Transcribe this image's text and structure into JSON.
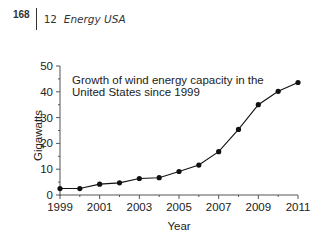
{
  "header": {
    "page_number": "168",
    "chapter_number": "12",
    "chapter_title": "Energy USA"
  },
  "chart_data": {
    "type": "line",
    "title_lines": [
      "Growth of wind energy capacity in the",
      "United States since 1999"
    ],
    "xlabel": "Year",
    "ylabel": "Gigawatts",
    "x": [
      1999,
      2000,
      2001,
      2002,
      2003,
      2004,
      2005,
      2006,
      2007,
      2008,
      2009,
      2010,
      2011
    ],
    "values": [
      2.5,
      2.5,
      4.2,
      4.7,
      6.4,
      6.7,
      9.1,
      11.6,
      16.8,
      25.4,
      35.0,
      40.2,
      43.6
    ],
    "ylim": [
      0,
      50
    ],
    "xlim": [
      1999,
      2011
    ],
    "yticks": [
      0,
      10,
      20,
      30,
      40,
      50
    ],
    "xtick_labels": [
      "1999",
      "2001",
      "2003",
      "2005",
      "2007",
      "2009",
      "2011"
    ],
    "grid": false,
    "legend": null,
    "marker": "filled-circle",
    "line_color": "#111111"
  }
}
